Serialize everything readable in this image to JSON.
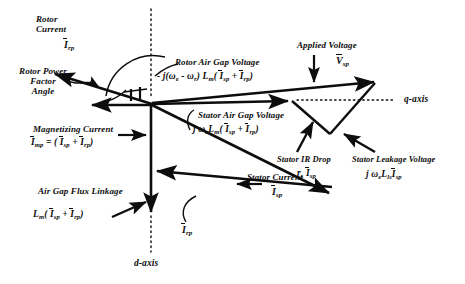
{
  "figure": {
    "type": "phasor-diagram",
    "title_present": false,
    "axes": {
      "q_axis_label": "q-axis",
      "d_axis_label": "d-axis"
    },
    "labels": {
      "rotor_current": {
        "caption_line1": "Rotor",
        "caption_line2": "Current",
        "symbol_base": "I",
        "symbol_sub": "rp"
      },
      "rotor_power_factor_angle": {
        "line1": "Rotor Power",
        "line2": "Factor",
        "line3": "Angle"
      },
      "magnetizing_current": {
        "caption": "Magnetizing Current",
        "eq_lhs_base": "I",
        "eq_lhs_sub": "mp",
        "eq_mid": "= (",
        "eq_a_base": "I",
        "eq_a_sub": "sp",
        "eq_plus": "+",
        "eq_b_base": "I",
        "eq_b_sub": "rp",
        "eq_close": ")"
      },
      "air_gap_flux_linkage": {
        "caption": "Air Gap Flux Linkage",
        "eq_coef_base": "L",
        "eq_coef_sub": "m",
        "eq_open": "(",
        "eq_a_base": "I",
        "eq_a_sub": "sp",
        "eq_plus": "+",
        "eq_b_base": "I",
        "eq_b_sub": "rp",
        "eq_close": ")"
      },
      "rotor_air_gap_voltage": {
        "caption": "Rotor Air Gap Voltage",
        "eq_sign": "-",
        "eq_j": "j(",
        "eq_w1_base": "ω",
        "eq_w1_sub": "e",
        "eq_minus": "-",
        "eq_w2_base": "ω",
        "eq_w2_sub": "r",
        "eq_closeparen": ")",
        "eq_L_base": "L",
        "eq_L_sub": "m",
        "eq_open": "(",
        "eq_a_base": "I",
        "eq_a_sub": "sp",
        "eq_plus": "+",
        "eq_b_base": "I",
        "eq_b_sub": "rp",
        "eq_close": ")"
      },
      "stator_air_gap_voltage": {
        "caption": "Stator Air Gap Voltage",
        "eq_j": "j",
        "eq_w_base": "ω",
        "eq_w_sub": "e",
        "eq_L_base": "L",
        "eq_L_sub": "m",
        "eq_open": "(",
        "eq_a_base": "I",
        "eq_a_sub": "sp",
        "eq_plus": "+",
        "eq_b_base": "I",
        "eq_b_sub": "rp",
        "eq_close": ")"
      },
      "applied_voltage": {
        "caption": "Applied Voltage",
        "symbol_base": "V",
        "symbol_sub": "sp"
      },
      "stator_ir_drop": {
        "caption": "Stator IR Drop",
        "eq_r_base": "r",
        "eq_r_sub": "s",
        "eq_i_base": "I",
        "eq_i_sub": "sp"
      },
      "stator_leakage_voltage": {
        "caption": "Stator Leakage Voltage",
        "eq_j": "j",
        "eq_w_base": "ω",
        "eq_w_sub": "e",
        "eq_L_base": "L",
        "eq_L_sub": "ls",
        "eq_i_base": "I",
        "eq_i_sub": "sp"
      },
      "stator_current": {
        "caption": "Stator Current",
        "symbol_base": "I",
        "symbol_sub": "sp"
      },
      "rotor_current_leader": {
        "symbol_base": "I",
        "symbol_sub": "rp"
      }
    },
    "colors": {
      "ink": "#0d0d0d",
      "background": "#ffffff"
    },
    "geometry": {
      "origin": [
        152,
        104
      ],
      "vectors": [
        {
          "name": "rotor-current",
          "from": [
            152,
            104
          ],
          "to": [
            52,
            73
          ]
        },
        {
          "name": "magnetizing-current-left",
          "from": [
            152,
            104
          ],
          "to": [
            88,
            104
          ]
        },
        {
          "name": "air-gap-flux-linkage",
          "from": [
            152,
            104
          ],
          "to": [
            151,
            216
          ]
        },
        {
          "name": "stator-air-gap-voltage",
          "from": [
            152,
            104
          ],
          "to": [
            292,
            101
          ]
        },
        {
          "name": "rotor-air-gap-voltage",
          "from": [
            152,
            104
          ],
          "to": [
            377,
            81
          ]
        },
        {
          "name": "stator-current",
          "from": [
            152,
            104
          ],
          "to": [
            332,
            196
          ]
        },
        {
          "name": "rotor-current-resultant",
          "from": [
            330,
            185
          ],
          "to": [
            152,
            170
          ]
        },
        {
          "name": "stator-ir-drop",
          "from": [
            292,
            101
          ],
          "to": [
            330,
            134
          ]
        },
        {
          "name": "stator-leakage-voltage",
          "from": [
            330,
            134
          ],
          "to": [
            377,
            81
          ]
        }
      ],
      "dotted_axes": [
        {
          "name": "d-axis",
          "from": [
            151,
            10
          ],
          "to": [
            151,
            252
          ]
        },
        {
          "name": "q-axis",
          "from": [
            299,
            100
          ],
          "to": [
            395,
            100
          ]
        }
      ]
    }
  }
}
